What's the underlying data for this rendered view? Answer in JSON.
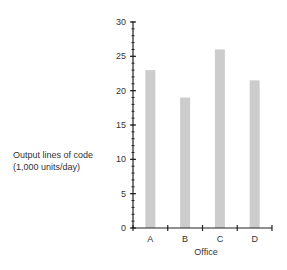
{
  "chart_data": {
    "type": "bar",
    "title": "",
    "xlabel": "Office",
    "ylabel": "Output lines of code (1,000 units/day)",
    "ylabel_lines": [
      "Output lines of code",
      "(1,000 units/day)"
    ],
    "categories": [
      "A",
      "B",
      "C",
      "D"
    ],
    "values": [
      23,
      19,
      26,
      21.5
    ],
    "ylim": [
      0,
      30
    ],
    "yticks": [
      0,
      5,
      10,
      15,
      20,
      25,
      30
    ],
    "minor_tick_step": 1,
    "grid": false,
    "legend": null,
    "bar_color": "#cccccc",
    "axis_color": "#222222"
  }
}
